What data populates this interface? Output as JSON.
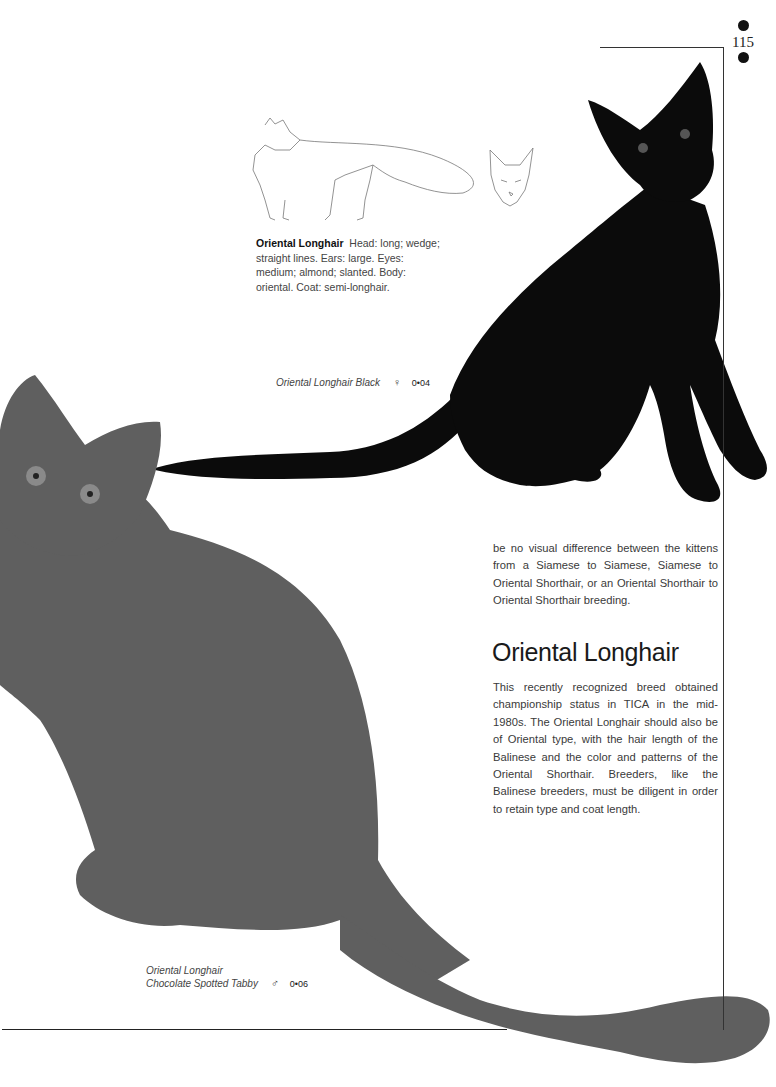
{
  "page": {
    "folio": "115"
  },
  "sketch": {
    "description": "line-drawing-body-and-head-profile"
  },
  "breed_summary": {
    "title": "Oriental Longhair",
    "text": "Head: long; wedge; straight lines. Ears: large. Eyes: medium; almond; slanted. Body: oriental. Coat: semi-longhair."
  },
  "captions": [
    {
      "lines": [
        "Oriental Longhair Black"
      ],
      "sex_symbol": "♀",
      "code": "0•04"
    },
    {
      "lines": [
        "Oriental Longhair",
        "Chocolate Spotted Tabby"
      ],
      "sex_symbol": "♂",
      "code": "0•06"
    }
  ],
  "article": {
    "para1": "be no visual difference between the kittens from a Siamese to Siamese, Siamese to Oriental Shorthair, or an Oriental Shorthair to Oriental Shorthair breeding.",
    "heading": "Oriental Longhair",
    "para2": "This recently recognized breed obtained championship status in TICA in the mid-1980s. The Oriental Longhair should also be of Oriental type, with the hair length of the Balinese and the color and patterns of the Oriental Shorthair. Breeders, like the Balinese breeders, must be diligent in order to retain type and coat length."
  },
  "colors": {
    "black_cat": "#0b0b0b",
    "tabby_cat": "#5f5f5f",
    "rule": "#333333"
  }
}
